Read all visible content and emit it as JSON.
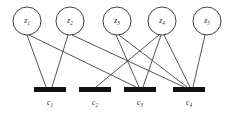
{
  "figure": {
    "kind": "tanner-graph",
    "width": 237,
    "height": 116,
    "background_color": "#ffffff",
    "edge_color": "#2a2a2a",
    "node_stroke_color": "#2a2a2a",
    "node_fill_color": "#ffffff",
    "check_node_color": "#111111",
    "label_color": "#1a1a1a"
  },
  "variable_nodes": [
    {
      "id": "z1",
      "base": "z",
      "sub": "1",
      "cx": 27,
      "cy": 21,
      "r": 14
    },
    {
      "id": "z2",
      "base": "z",
      "sub": "2",
      "cx": 70,
      "cy": 21,
      "r": 14
    },
    {
      "id": "z3",
      "base": "z",
      "sub": "3",
      "cx": 117,
      "cy": 21,
      "r": 14
    },
    {
      "id": "z4",
      "base": "z",
      "sub": "4",
      "cx": 162,
      "cy": 21,
      "r": 14
    },
    {
      "id": "z5",
      "base": "z",
      "sub": "5",
      "cx": 207,
      "cy": 21,
      "r": 14
    }
  ],
  "check_nodes": [
    {
      "id": "c1",
      "base": "c",
      "sub": "1",
      "x": 34,
      "y": 87,
      "w": 32,
      "h": 5,
      "cx": 50,
      "label_x": 50,
      "label_y": 103
    },
    {
      "id": "c2",
      "base": "c",
      "sub": "2",
      "x": 79,
      "y": 87,
      "w": 32,
      "h": 5,
      "cx": 95,
      "label_x": 95,
      "label_y": 103
    },
    {
      "id": "c3",
      "base": "c",
      "sub": "3",
      "x": 124,
      "y": 87,
      "w": 32,
      "h": 5,
      "cx": 140,
      "label_x": 140,
      "label_y": 103
    },
    {
      "id": "c4",
      "base": "c",
      "sub": "4",
      "x": 173,
      "y": 87,
      "w": 32,
      "h": 5,
      "cx": 189,
      "label_x": 189,
      "label_y": 103
    }
  ],
  "edges": [
    {
      "from": "z1",
      "to": "c1",
      "x1": 27,
      "y1": 35,
      "x2": 46,
      "y2": 87
    },
    {
      "from": "z1",
      "to": "c3",
      "x1": 29,
      "y1": 35,
      "x2": 136,
      "y2": 87
    },
    {
      "from": "z2",
      "to": "c1",
      "x1": 68,
      "y1": 35,
      "x2": 52,
      "y2": 87
    },
    {
      "from": "z2",
      "to": "c4",
      "x1": 72,
      "y1": 35,
      "x2": 184,
      "y2": 87
    },
    {
      "from": "z3",
      "to": "c3",
      "x1": 116,
      "y1": 35,
      "x2": 139,
      "y2": 87
    },
    {
      "from": "z3",
      "to": "c4",
      "x1": 119,
      "y1": 35,
      "x2": 187,
      "y2": 87
    },
    {
      "from": "z4",
      "to": "c2",
      "x1": 159,
      "y1": 35,
      "x2": 96,
      "y2": 87
    },
    {
      "from": "z4",
      "to": "c3",
      "x1": 161,
      "y1": 35,
      "x2": 143,
      "y2": 87
    },
    {
      "from": "z4",
      "to": "c4",
      "x1": 164,
      "y1": 35,
      "x2": 190,
      "y2": 87
    },
    {
      "from": "z5",
      "to": "c4",
      "x1": 205,
      "y1": 35,
      "x2": 193,
      "y2": 87
    }
  ]
}
